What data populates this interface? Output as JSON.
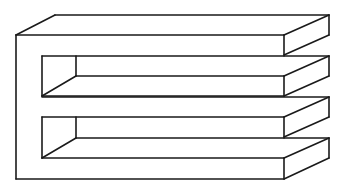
{
  "figure": {
    "stroke_color": "#1a1a1a",
    "background_color": "#ffffff",
    "left_slots": 2,
    "right_prongs": 4
  }
}
